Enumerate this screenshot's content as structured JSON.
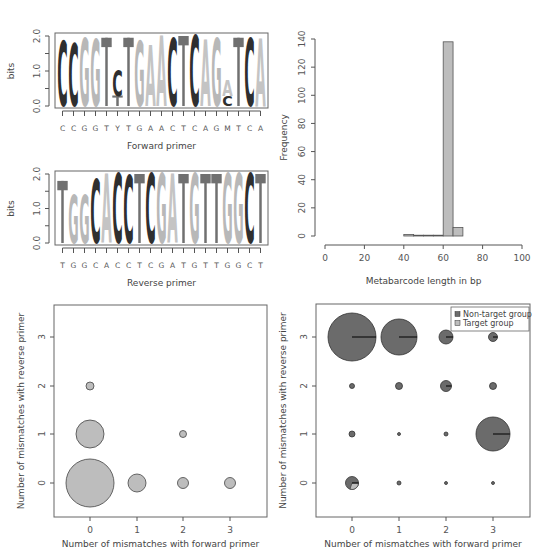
{
  "colors": {
    "C": "#2f2f2f",
    "G": "#b8b8b8",
    "A": "#c4c4c4",
    "T": "#707070",
    "bubble": "#bdbdbd",
    "non_target": "#6b6b6b",
    "target": "#bdbdbd",
    "axis": "#555555"
  },
  "chart_data": [
    {
      "type": "sequence-logo",
      "id": "forward",
      "xlabel": "Forward primer",
      "ylabel": "bits",
      "ylim": [
        0,
        2
      ],
      "yticks": [
        "0.0",
        "1.0",
        "2.0"
      ],
      "consensus": [
        "C",
        "C",
        "G",
        "G",
        "T",
        "Y",
        "T",
        "G",
        "A",
        "A",
        "C",
        "T",
        "C",
        "A",
        "G",
        "M",
        "T",
        "C",
        "A"
      ],
      "positions": [
        {
          "stack": [
            [
              "C",
              1.85
            ]
          ]
        },
        {
          "stack": [
            [
              "C",
              1.8
            ]
          ]
        },
        {
          "stack": [
            [
              "G",
              1.95
            ]
          ]
        },
        {
          "stack": [
            [
              "G",
              1.9
            ]
          ]
        },
        {
          "stack": [
            [
              "T",
              1.95
            ]
          ]
        },
        {
          "stack": [
            [
              "T",
              0.3
            ],
            [
              "C",
              0.75
            ]
          ]
        },
        {
          "stack": [
            [
              "T",
              1.95
            ]
          ]
        },
        {
          "stack": [
            [
              "G",
              1.85
            ]
          ]
        },
        {
          "stack": [
            [
              "A",
              1.75
            ]
          ]
        },
        {
          "stack": [
            [
              "A",
              2.0
            ]
          ]
        },
        {
          "stack": [
            [
              "C",
              1.95
            ]
          ]
        },
        {
          "stack": [
            [
              "T",
              2.0
            ]
          ]
        },
        {
          "stack": [
            [
              "C",
              2.0
            ]
          ]
        },
        {
          "stack": [
            [
              "A",
              1.9
            ]
          ]
        },
        {
          "stack": [
            [
              "G",
              1.95
            ]
          ]
        },
        {
          "stack": [
            [
              "C",
              0.3
            ],
            [
              "A",
              0.45
            ]
          ]
        },
        {
          "stack": [
            [
              "T",
              1.95
            ]
          ]
        },
        {
          "stack": [
            [
              "C",
              1.95
            ]
          ]
        },
        {
          "stack": [
            [
              "A",
              1.95
            ]
          ]
        }
      ]
    },
    {
      "type": "sequence-logo",
      "id": "reverse",
      "xlabel": "Reverse primer",
      "ylabel": "bits",
      "ylim": [
        0,
        2
      ],
      "yticks": [
        "0.0",
        "1.0",
        "2.0"
      ],
      "consensus": [
        "T",
        "G",
        "G",
        "C",
        "A",
        "C",
        "C",
        "T",
        "C",
        "G",
        "A",
        "T",
        "G",
        "T",
        "T",
        "G",
        "G",
        "C",
        "T"
      ],
      "positions": [
        {
          "stack": [
            [
              "T",
              1.8
            ]
          ]
        },
        {
          "stack": [
            [
              "G",
              1.4
            ]
          ]
        },
        {
          "stack": [
            [
              "G",
              1.4
            ]
          ]
        },
        {
          "stack": [
            [
              "C",
              1.85
            ]
          ]
        },
        {
          "stack": [
            [
              "A",
              2.0
            ]
          ]
        },
        {
          "stack": [
            [
              "C",
              2.0
            ]
          ]
        },
        {
          "stack": [
            [
              "C",
              1.95
            ]
          ]
        },
        {
          "stack": [
            [
              "T",
              2.0
            ]
          ]
        },
        {
          "stack": [
            [
              "C",
              2.0
            ]
          ]
        },
        {
          "stack": [
            [
              "G",
              2.0
            ]
          ]
        },
        {
          "stack": [
            [
              "A",
              2.0
            ]
          ]
        },
        {
          "stack": [
            [
              "T",
              2.0
            ]
          ]
        },
        {
          "stack": [
            [
              "G",
              2.0
            ]
          ]
        },
        {
          "stack": [
            [
              "T",
              2.0
            ]
          ]
        },
        {
          "stack": [
            [
              "T",
              2.0
            ]
          ]
        },
        {
          "stack": [
            [
              "G",
              2.0
            ]
          ]
        },
        {
          "stack": [
            [
              "G",
              2.0
            ]
          ]
        },
        {
          "stack": [
            [
              "C",
              2.0
            ]
          ]
        },
        {
          "stack": [
            [
              "T",
              2.0
            ]
          ]
        }
      ]
    },
    {
      "type": "bar",
      "id": "histogram",
      "xlabel": "Metabarcode length in bp",
      "ylabel": "Frequency",
      "xlim": [
        0,
        100
      ],
      "ylim": [
        0,
        140
      ],
      "xticks": [
        0,
        20,
        40,
        60,
        80,
        100
      ],
      "yticks": [
        0,
        20,
        40,
        60,
        80,
        100,
        120,
        140
      ],
      "bins": [
        {
          "from": 40,
          "to": 45,
          "count": 1
        },
        {
          "from": 45,
          "to": 50,
          "count": 0
        },
        {
          "from": 50,
          "to": 55,
          "count": 0
        },
        {
          "from": 55,
          "to": 60,
          "count": 0
        },
        {
          "from": 60,
          "to": 65,
          "count": 138
        },
        {
          "from": 65,
          "to": 70,
          "count": 6
        }
      ]
    },
    {
      "type": "scatter",
      "id": "target-bubbles",
      "xlabel": "Number of mismatches with forward primer",
      "ylabel": "Number of mismatches with reverse primer",
      "xticks": [
        0,
        1,
        2,
        3
      ],
      "yticks": [
        0,
        1,
        2,
        3
      ],
      "points": [
        {
          "x": 0,
          "y": 0,
          "r": 24
        },
        {
          "x": 0,
          "y": 1,
          "r": 14
        },
        {
          "x": 0,
          "y": 2,
          "r": 4
        },
        {
          "x": 1,
          "y": 0,
          "r": 9
        },
        {
          "x": 2,
          "y": 0,
          "r": 5.5
        },
        {
          "x": 2,
          "y": 1,
          "r": 3.5
        },
        {
          "x": 3,
          "y": 0,
          "r": 5.5
        }
      ]
    },
    {
      "type": "pie-scatter",
      "id": "group-bubbles",
      "xlabel": "Number of mismatches with forward primer",
      "ylabel": "Number of mismatches with reverse primer",
      "xticks": [
        0,
        1,
        2,
        3
      ],
      "yticks": [
        0,
        1,
        2,
        3
      ],
      "legend": [
        {
          "label": "Non-target group",
          "color_key": "non_target"
        },
        {
          "label": "Target group",
          "color_key": "target"
        }
      ],
      "points": [
        {
          "x": 0,
          "y": 3,
          "r": 24,
          "target_frac": 0
        },
        {
          "x": 1,
          "y": 3,
          "r": 18,
          "target_frac": 0
        },
        {
          "x": 2,
          "y": 3,
          "r": 7,
          "target_frac": 0
        },
        {
          "x": 3,
          "y": 3,
          "r": 4.5,
          "target_frac": 0
        },
        {
          "x": 0,
          "y": 2,
          "r": 2.5,
          "target_frac": 0
        },
        {
          "x": 1,
          "y": 2,
          "r": 3.5,
          "target_frac": 0
        },
        {
          "x": 2,
          "y": 2,
          "r": 5.5,
          "target_frac": 0
        },
        {
          "x": 3,
          "y": 2,
          "r": 3.5,
          "target_frac": 0
        },
        {
          "x": 0,
          "y": 1,
          "r": 3,
          "target_frac": 0
        },
        {
          "x": 1,
          "y": 1,
          "r": 1.5,
          "target_frac": 0
        },
        {
          "x": 2,
          "y": 1,
          "r": 2,
          "target_frac": 0
        },
        {
          "x": 3,
          "y": 1,
          "r": 17,
          "target_frac": 0
        },
        {
          "x": 0,
          "y": 0,
          "r": 6.5,
          "target_frac": 0.3
        },
        {
          "x": 1,
          "y": 0,
          "r": 2,
          "target_frac": 0
        },
        {
          "x": 2,
          "y": 0,
          "r": 1.5,
          "target_frac": 0
        },
        {
          "x": 3,
          "y": 0,
          "r": 1.5,
          "target_frac": 0
        }
      ]
    }
  ]
}
